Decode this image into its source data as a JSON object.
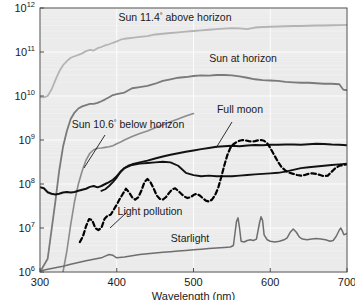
{
  "chart_data": {
    "type": "line",
    "title": "",
    "xlabel": "Wavelength (nm)",
    "ylabel": "",
    "xlim": [
      300,
      700
    ],
    "ylim": [
      1000000,
      1000000000000
    ],
    "yscale": "log",
    "xticks": [
      300,
      400,
      500,
      600,
      700
    ],
    "xtick_labels": [
      "300",
      "400",
      "500",
      "600",
      "700"
    ],
    "yticks": [
      1000000,
      10000000,
      100000000,
      1000000000,
      10000000000,
      100000000000,
      1000000000000
    ],
    "ytick_labels": [
      "10^6",
      "10^7",
      "10^8",
      "10^9",
      "10^10",
      "10^11",
      "10^12"
    ],
    "ytick_mantissa": "10",
    "ytick_exponents": [
      "6",
      "7",
      "8",
      "9",
      "10",
      "11",
      "12"
    ],
    "grid": true,
    "legend": "inline-annotations",
    "plot_bg_color": "#ebebeb",
    "grid_color": "#ffffff",
    "frame_color": "#4d4d4d",
    "series": [
      {
        "name": "Sun 11.4° above horizon",
        "color": "#b4b4b4",
        "style": "solid",
        "width": 1.8,
        "label_x": 175,
        "label_y": 21,
        "label_anchor": "middle",
        "leader": null,
        "x": [
          300,
          305,
          310,
          315,
          320,
          325,
          330,
          335,
          340,
          345,
          350,
          355,
          360,
          365,
          370,
          375,
          380,
          385,
          390,
          395,
          400,
          405,
          410,
          420,
          430,
          440,
          450,
          460,
          470,
          480,
          490,
          500,
          510,
          520,
          530,
          540,
          550,
          560,
          570,
          580,
          590,
          600,
          610,
          620,
          630,
          640,
          650,
          660,
          670,
          680,
          690,
          700
        ],
        "y": [
          9500000000.0,
          9300000000.0,
          10000000000.0,
          14000000000.0,
          23000000000.0,
          36000000000.0,
          50000000000.0,
          62000000000.0,
          74000000000.0,
          80000000000.0,
          86000000000.0,
          93000000000.0,
          105000000000.0,
          112000000000.0,
          108000000000.0,
          122000000000.0,
          130000000000.0,
          142000000000.0,
          150000000000.0,
          162000000000.0,
          174000000000.0,
          190000000000.0,
          200000000000.0,
          210000000000.0,
          220000000000.0,
          230000000000.0,
          250000000000.0,
          260000000000.0,
          270000000000.0,
          280000000000.0,
          290000000000.0,
          300000000000.0,
          310000000000.0,
          320000000000.0,
          330000000000.0,
          340000000000.0,
          350000000000.0,
          345000000000.0,
          330000000000.0,
          360000000000.0,
          370000000000.0,
          375000000000.0,
          380000000000.0,
          385000000000.0,
          390000000000.0,
          390000000000.0,
          395000000000.0,
          400000000000.0,
          400000000000.0,
          405000000000.0,
          410000000000.0,
          415000000000.0
        ]
      },
      {
        "name": "Sun at horizon",
        "color": "#7a7a7a",
        "style": "solid",
        "width": 1.8,
        "label_x": 243,
        "label_y": 62,
        "label_anchor": "middle",
        "leader": null,
        "x": [
          300,
          310,
          320,
          325,
          330,
          335,
          340,
          345,
          350,
          355,
          360,
          365,
          370,
          375,
          380,
          385,
          390,
          395,
          400,
          410,
          420,
          430,
          440,
          450,
          460,
          470,
          480,
          490,
          500,
          510,
          520,
          530,
          540,
          550,
          560,
          570,
          580,
          590,
          600,
          610,
          620,
          630,
          640,
          650,
          660,
          670,
          680,
          690,
          695,
          700
        ],
        "y": [
          1000000.0,
          2000000.0,
          40000000.0,
          200000000.0,
          700000000.0,
          1600000000.0,
          3000000000.0,
          4200000000.0,
          5200000000.0,
          5800000000.0,
          6200000000.0,
          6600000000.0,
          6600000000.0,
          7000000000.0,
          7600000000.0,
          8400000000.0,
          9400000000.0,
          10500000000.0,
          11000000000.0,
          12000000000.0,
          15000000000.0,
          16000000000.0,
          17000000000.0,
          19000000000.0,
          22000000000.0,
          24000000000.0,
          26000000000.0,
          27000000000.0,
          28500000000.0,
          29500000000.0,
          29000000000.0,
          30000000000.0,
          30000000000.0,
          29500000000.0,
          28000000000.0,
          26000000000.0,
          24000000000.0,
          23000000000.0,
          22500000000.0,
          22000000000.0,
          21000000000.0,
          20500000000.0,
          20000000000.0,
          20000000000.0,
          19500000000.0,
          19000000000.0,
          19000000000.0,
          18500000000.0,
          14000000000.0,
          13500000000.0
        ]
      },
      {
        "name": "Sun 10.6° below horizon",
        "color": "#8c8c8c",
        "style": "solid",
        "width": 1.6,
        "label_x": 128,
        "label_y": 128,
        "label_anchor": "middle",
        "leader": {
          "x1": 105,
          "y1": 135,
          "x2": 84,
          "y2": 168
        },
        "x": [
          330,
          335,
          340,
          345,
          350,
          355,
          360,
          365,
          370,
          375,
          380,
          385,
          390,
          395,
          400,
          405,
          410,
          415,
          420,
          430,
          440,
          450,
          460,
          470,
          480,
          490,
          500
        ],
        "y": [
          1000000.0,
          3000000.0,
          12000000.0,
          40000000.0,
          100000000.0,
          200000000.0,
          350000000.0,
          500000000.0,
          600000000.0,
          650000000.0,
          660000000.0,
          680000000.0,
          700000000.0,
          740000000.0,
          820000000.0,
          900000000.0,
          1000000000.0,
          1100000000.0,
          1200000000.0,
          1400000000.0,
          1600000000.0,
          1900000000.0,
          2200000000.0,
          2600000000.0,
          3000000000.0,
          3500000000.0,
          4000000000.0
        ]
      },
      {
        "name": "Full moon",
        "color": "#111111",
        "style": "solid",
        "width": 2.0,
        "label_x": 240,
        "label_y": 113,
        "label_anchor": "middle",
        "leader": {
          "x1": 232,
          "y1": 122,
          "x2": 216,
          "y2": 148
        },
        "x": [
          300,
          305,
          310,
          315,
          320,
          325,
          330,
          335,
          340,
          345,
          350,
          355,
          360,
          365,
          370,
          375,
          380,
          385,
          390,
          395,
          400,
          405,
          410,
          415,
          420,
          430,
          440,
          450,
          460,
          470,
          480,
          490,
          500,
          510,
          520,
          530,
          540,
          550,
          560,
          570,
          580,
          590,
          600,
          610,
          620,
          630,
          640,
          650,
          660,
          670,
          680,
          690,
          700
        ],
        "y": [
          85000000.0,
          80000000.0,
          65000000.0,
          60000000.0,
          58000000.0,
          60000000.0,
          64000000.0,
          66000000.0,
          64000000.0,
          66000000.0,
          70000000.0,
          74000000.0,
          78000000.0,
          86000000.0,
          90000000.0,
          84000000.0,
          90000000.0,
          100000000.0,
          110000000.0,
          125000000.0,
          150000000.0,
          190000000.0,
          230000000.0,
          260000000.0,
          280000000.0,
          310000000.0,
          340000000.0,
          380000000.0,
          420000000.0,
          460000000.0,
          500000000.0,
          540000000.0,
          580000000.0,
          620000000.0,
          660000000.0,
          700000000.0,
          720000000.0,
          740000000.0,
          720000000.0,
          750000000.0,
          770000000.0,
          760000000.0,
          780000000.0,
          780000000.0,
          790000000.0,
          790000000.0,
          780000000.0,
          800000000.0,
          820000000.0,
          810000000.0,
          790000000.0,
          780000000.0,
          760000000.0
        ]
      },
      {
        "name": "Airglow",
        "color": "#111111",
        "style": "solid",
        "width": 1.8,
        "label_x": null,
        "label_y": null,
        "leader": null,
        "x": [
          380,
          385,
          390,
          395,
          400,
          405,
          410,
          420,
          430,
          440,
          450,
          460,
          470,
          480,
          490,
          500,
          510,
          520,
          530,
          540,
          550,
          560,
          570,
          580,
          590,
          600,
          610,
          620,
          630,
          640,
          650,
          660,
          670,
          680,
          690,
          700
        ],
        "y": [
          70000000.0,
          76000000.0,
          90000000.0,
          110000000.0,
          140000000.0,
          190000000.0,
          230000000.0,
          270000000.0,
          290000000.0,
          300000000.0,
          310000000.0,
          320000000.0,
          310000000.0,
          260000000.0,
          180000000.0,
          160000000.0,
          150000000.0,
          155000000.0,
          150000000.0,
          150000000.0,
          150000000.0,
          155000000.0,
          160000000.0,
          165000000.0,
          170000000.0,
          175000000.0,
          180000000.0,
          190000000.0,
          210000000.0,
          230000000.0,
          240000000.0,
          250000000.0,
          260000000.0,
          270000000.0,
          280000000.0,
          290000000.0
        ]
      },
      {
        "name": "Light pollution",
        "color": "#000000",
        "style": "dashed",
        "width": 2.2,
        "label_x": 150,
        "label_y": 215,
        "label_anchor": "middle",
        "leader": {
          "x1": 126,
          "y1": 213,
          "x2": 110,
          "y2": 228
        },
        "x": [
          352,
          356,
          360,
          364,
          368,
          372,
          376,
          380,
          384,
          388,
          392,
          396,
          400,
          404,
          408,
          412,
          416,
          420,
          424,
          428,
          432,
          436,
          440,
          444,
          448,
          452,
          456,
          460,
          464,
          468,
          472,
          476,
          480,
          484,
          488,
          492,
          496,
          500,
          504,
          508,
          512,
          516,
          520,
          524,
          528,
          532,
          536,
          540,
          544,
          548,
          552,
          556,
          560,
          564,
          568,
          572,
          576,
          580,
          584,
          588,
          592,
          596,
          600,
          605,
          610,
          615,
          620,
          625,
          630,
          635,
          640,
          645,
          650,
          655,
          660,
          665,
          670,
          675,
          680,
          685,
          690,
          695,
          700
        ],
        "y": [
          4800000.0,
          6500000.0,
          11000000.0,
          16000000.0,
          15000000.0,
          10000000.0,
          9000000.0,
          10000000.0,
          16000000.0,
          19000000.0,
          20000000.0,
          26000000.0,
          34000000.0,
          46000000.0,
          60000000.0,
          78000000.0,
          65000000.0,
          50000000.0,
          44000000.0,
          50000000.0,
          70000000.0,
          110000000.0,
          130000000.0,
          110000000.0,
          80000000.0,
          55000000.0,
          46000000.0,
          44000000.0,
          50000000.0,
          62000000.0,
          75000000.0,
          80000000.0,
          70000000.0,
          60000000.0,
          52000000.0,
          48000000.0,
          50000000.0,
          56000000.0,
          60000000.0,
          55000000.0,
          48000000.0,
          42000000.0,
          40000000.0,
          44000000.0,
          55000000.0,
          80000000.0,
          140000000.0,
          260000000.0,
          450000000.0,
          660000000.0,
          800000000.0,
          900000000.0,
          960000000.0,
          1000000000.0,
          980000000.0,
          940000000.0,
          920000000.0,
          940000000.0,
          980000000.0,
          1000000000.0,
          960000000.0,
          840000000.0,
          660000000.0,
          460000000.0,
          320000000.0,
          240000000.0,
          200000000.0,
          180000000.0,
          170000000.0,
          160000000.0,
          155000000.0,
          160000000.0,
          170000000.0,
          175000000.0,
          170000000.0,
          160000000.0,
          150000000.0,
          155000000.0,
          190000000.0,
          230000000.0,
          260000000.0,
          270000000.0,
          280000000.0
        ]
      },
      {
        "name": "Starlight",
        "color": "#6e6e6e",
        "style": "solid",
        "width": 1.5,
        "label_x": 190,
        "label_y": 242,
        "label_anchor": "middle",
        "leader": null,
        "x": [
          300,
          310,
          320,
          330,
          340,
          350,
          360,
          370,
          380,
          385,
          390,
          395,
          400,
          410,
          420,
          430,
          440,
          450,
          460,
          470,
          480,
          490,
          500,
          510,
          520,
          530,
          540,
          548,
          552,
          556,
          558,
          560,
          562,
          566,
          570,
          574,
          578,
          582,
          586,
          588,
          590,
          592,
          596,
          600,
          606,
          612,
          618,
          622,
          626,
          630,
          634,
          638,
          642,
          648,
          654,
          660,
          666,
          672,
          678,
          682,
          686,
          690,
          692,
          694,
          696,
          700
        ],
        "y": [
          1050000.0,
          1150000.0,
          1250000.0,
          1350000.0,
          1500000.0,
          1650000.0,
          1800000.0,
          1950000.0,
          2100000.0,
          2300000.0,
          2500000.0,
          2400000.0,
          2100000.0,
          2200000.0,
          2350000.0,
          2500000.0,
          2600000.0,
          2700000.0,
          2800000.0,
          2900000.0,
          3000000.0,
          3100000.0,
          3200000.0,
          3300000.0,
          3400000.0,
          3500000.0,
          3600000.0,
          3700000.0,
          4000000.0,
          14000000.0,
          17000000.0,
          10000000.0,
          5000000.0,
          4800000.0,
          5200000.0,
          5400000.0,
          5200000.0,
          5600000.0,
          13000000.0,
          18000000.0,
          15000000.0,
          7000000.0,
          5400000.0,
          5000000.0,
          4800000.0,
          5000000.0,
          5400000.0,
          6000000.0,
          8000000.0,
          9500000.0,
          8000000.0,
          6200000.0,
          5600000.0,
          5400000.0,
          5600000.0,
          5800000.0,
          5600000.0,
          5400000.0,
          5000000.0,
          5200000.0,
          6500000.0,
          9000000.0,
          10000000.0,
          8500000.0,
          7000000.0,
          7500000.0
        ]
      }
    ],
    "annotations": [
      {
        "text": "Sun 11.4",
        "sup": "°",
        "rest": " above horizon"
      },
      {
        "text": "Sun at horizon"
      },
      {
        "text": "Sun 10.6",
        "sup": "°",
        "rest": " below horizon"
      },
      {
        "text": "Full moon"
      },
      {
        "text": "Light pollution"
      },
      {
        "text": "Starlight"
      }
    ]
  },
  "labels": {
    "sun_above": "Sun 11.4° above horizon",
    "sun_at": "Sun at horizon",
    "sun_below": "Sun 10.6° below horizon",
    "full_moon": "Full moon",
    "light_pollution": "Light pollution",
    "starlight": "Starlight",
    "xaxis": "Wavelength (nm)"
  }
}
